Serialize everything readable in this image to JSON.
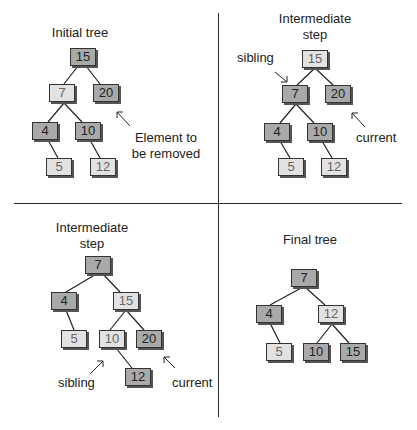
{
  "panels": [
    {
      "title": "Initial tree",
      "nodes": [
        {
          "value": "15",
          "shade": "dark"
        },
        {
          "value": "7",
          "shade": "light"
        },
        {
          "value": "20",
          "shade": "dark"
        },
        {
          "value": "4",
          "shade": "dark"
        },
        {
          "value": "10",
          "shade": "dark"
        },
        {
          "value": "5",
          "shade": "light"
        },
        {
          "value": "12",
          "shade": "light"
        }
      ],
      "annotations": [
        {
          "text": "Element to be removed"
        }
      ]
    },
    {
      "title": "Intermediate step",
      "nodes": [
        {
          "value": "15",
          "shade": "light"
        },
        {
          "value": "7",
          "shade": "dark"
        },
        {
          "value": "20",
          "shade": "dark"
        },
        {
          "value": "4",
          "shade": "dark"
        },
        {
          "value": "10",
          "shade": "dark"
        },
        {
          "value": "5",
          "shade": "light"
        },
        {
          "value": "12",
          "shade": "light"
        }
      ],
      "annotations": [
        {
          "text": "sibling"
        },
        {
          "text": "current"
        }
      ]
    },
    {
      "title": "Intermediate step",
      "nodes": [
        {
          "value": "7",
          "shade": "dark"
        },
        {
          "value": "4",
          "shade": "dark"
        },
        {
          "value": "15",
          "shade": "light"
        },
        {
          "value": "5",
          "shade": "light"
        },
        {
          "value": "10",
          "shade": "light"
        },
        {
          "value": "20",
          "shade": "dark"
        },
        {
          "value": "12",
          "shade": "dark"
        }
      ],
      "annotations": [
        {
          "text": "sibling"
        },
        {
          "text": "current"
        }
      ]
    },
    {
      "title": "Final tree",
      "nodes": [
        {
          "value": "7",
          "shade": "dark"
        },
        {
          "value": "4",
          "shade": "dark"
        },
        {
          "value": "12",
          "shade": "light"
        },
        {
          "value": "5",
          "shade": "light"
        },
        {
          "value": "10",
          "shade": "dark"
        },
        {
          "value": "15",
          "shade": "dark"
        }
      ],
      "annotations": []
    }
  ],
  "colors": {
    "dark_node": "#a9a9a9",
    "light_node": "#e2e2e2",
    "line": "#222222"
  }
}
